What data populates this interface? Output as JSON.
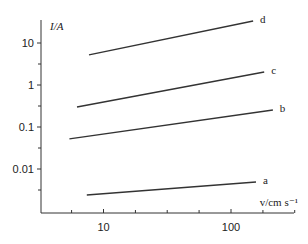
{
  "chart_data": {
    "type": "line",
    "title": "",
    "xlabel": "v/cm s⁻¹",
    "ylabel": "I/A",
    "xscale": "log",
    "yscale": "log",
    "xlim": [
      3.3,
      310
    ],
    "ylim": [
      0.001,
      35
    ],
    "grid": false,
    "legend": "inline labels at line ends (right)",
    "x_tick_labels": [
      {
        "value": 10,
        "label": "10"
      },
      {
        "value": 100,
        "label": "100"
      }
    ],
    "x_minor_ticks": [
      3.16,
      5.62,
      17.8,
      31.6,
      56.2,
      178,
      316
    ],
    "y_tick_labels": [
      {
        "value": 10,
        "label": "10"
      },
      {
        "value": 1,
        "label": "1"
      },
      {
        "value": 0.1,
        "label": "0.1"
      },
      {
        "value": 0.01,
        "label": "0.01"
      }
    ],
    "y_minor_ticks": [
      3.16,
      0.316,
      0.0316,
      0.00316
    ],
    "series": [
      {
        "name": "a",
        "x": [
          7.4,
          157
        ],
        "y": [
          0.0024,
          0.0049
        ]
      },
      {
        "name": "b",
        "x": [
          5.4,
          213
        ],
        "y": [
          0.052,
          0.254
        ]
      },
      {
        "name": "c",
        "x": [
          6.2,
          182
        ],
        "y": [
          0.3,
          2.04
        ]
      },
      {
        "name": "d",
        "x": [
          7.7,
          149
        ],
        "y": [
          5.2,
          33.4
        ]
      }
    ]
  }
}
